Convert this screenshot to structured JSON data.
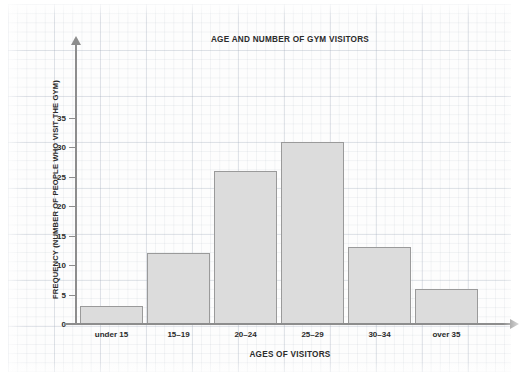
{
  "chart_data": {
    "type": "bar",
    "title": "AGE AND NUMBER OF GYM VISITORS",
    "xlabel": "AGES OF VISITORS",
    "ylabel": "FREQUENCY (NUMBER OF PEOPLE WHO VISIT THE GYM)",
    "categories": [
      "under 15",
      "15–19",
      "20–24",
      "25–29",
      "30–34",
      "over 35"
    ],
    "values": [
      3,
      12,
      26,
      31,
      13,
      6
    ],
    "ylim": [
      0,
      35
    ],
    "ytick_labels": [
      "0",
      "5",
      "10",
      "15",
      "20",
      "25",
      "30",
      "35"
    ],
    "ytick_values": [
      0,
      5,
      10,
      15,
      20,
      25,
      30,
      35
    ],
    "grid": true,
    "legend": "none",
    "bar_fill_color": "#dcdcdc",
    "bar_border_color": "#9a9a9a",
    "axis_color": "#8d8d8d",
    "text_color": "#2b2b2b",
    "background_color": "#fdfdfd"
  }
}
